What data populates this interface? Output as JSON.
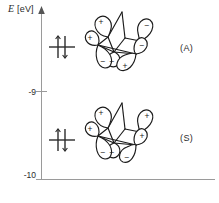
{
  "figure": {
    "type": "molecular-orbital-energy-level-diagram",
    "background_color": "#ffffff",
    "ink_color": "#2b2b2b",
    "axis_color": "#9a9a9a"
  },
  "axis": {
    "y_label": "E",
    "y_units": "[eV]",
    "ticks": [
      {
        "value": -9,
        "label": "-9"
      },
      {
        "value": -10,
        "label": "-10"
      }
    ],
    "y_min": -10,
    "y_max": -8.45,
    "arrow": "up-arrow-icon"
  },
  "levels": [
    {
      "id": "A",
      "symmetry_label": "(A)",
      "energy": -8.92,
      "occupancy": "paired",
      "electron_symbol": "electron-pair-icon"
    },
    {
      "id": "S",
      "symmetry_label": "(S)",
      "energy": -9.55,
      "occupancy": "paired",
      "electron_symbol": "electron-pair-icon"
    }
  ],
  "orbitals": [
    {
      "id": "A",
      "name": "antisymmetric-orbital",
      "description": "norbornadiene-pi-antisymmetric-combination",
      "lobe_signs": {
        "upper_left": "+",
        "upper_right": "−",
        "far_left": "+",
        "mid_right": "−",
        "center": "−",
        "lower_left": "−",
        "lower_right": "+"
      }
    },
    {
      "id": "S",
      "name": "symmetric-orbital",
      "description": "norbornadiene-pi-symmetric-combination",
      "lobe_signs": {
        "upper_left": "+",
        "upper_right": "+",
        "far_left": "+",
        "mid_right": "+",
        "center": "−",
        "lower_left": "−",
        "lower_right": "−"
      }
    }
  ]
}
